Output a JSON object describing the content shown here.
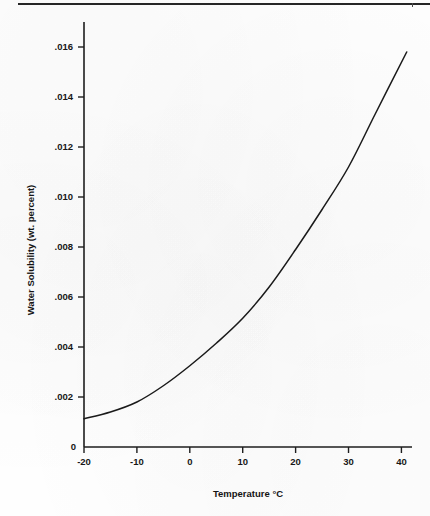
{
  "page": {
    "background_color": "#fefefe",
    "rule_color": "#262626"
  },
  "chart_data": {
    "type": "line",
    "title": "",
    "subtitle": "",
    "xlabel": "Temperature °C",
    "ylabel": "Water Solubility (wt. percent)",
    "xlim": [
      -20,
      42
    ],
    "ylim": [
      0,
      0.017
    ],
    "grid": false,
    "legend": null,
    "legend_position": "none",
    "line_color": "#1a1a1a",
    "x_ticks": [
      -20,
      -10,
      0,
      10,
      20,
      30,
      40
    ],
    "x_tick_labels": [
      "-20",
      "-10",
      "0",
      "10",
      "20",
      "30",
      "40"
    ],
    "y_ticks": [
      0.002,
      0.004,
      0.006,
      0.008,
      0.01,
      0.012,
      0.014,
      0.016
    ],
    "y_tick_labels": [
      ".002",
      ".004",
      ".006",
      ".008",
      ".010",
      ".012",
      ".014",
      ".016"
    ],
    "y_origin_label": "0",
    "x": [
      -20,
      -15,
      -10,
      -5,
      0,
      5,
      10,
      15,
      20,
      25,
      30,
      35,
      41
    ],
    "series": [
      {
        "name": "Water solubility",
        "values": [
          0.00113,
          0.0014,
          0.0018,
          0.00245,
          0.00325,
          0.00415,
          0.00515,
          0.0064,
          0.0079,
          0.0095,
          0.0112,
          0.0133,
          0.0158
        ]
      }
    ],
    "annotations": []
  },
  "axis_labels": {
    "x_title": "Temperature °C",
    "y_title": "Water Solubility (wt. percent)"
  }
}
